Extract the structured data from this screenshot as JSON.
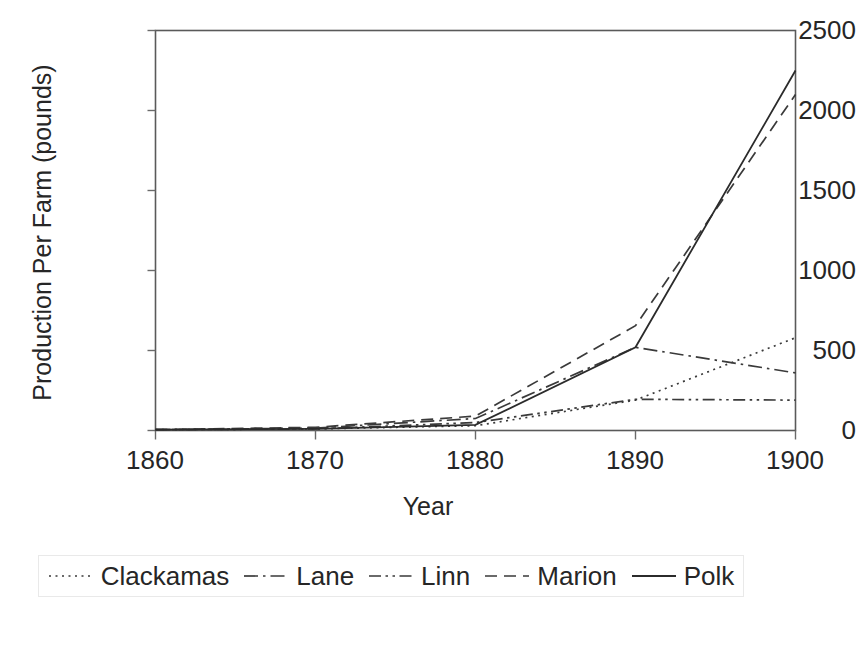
{
  "chart_data": {
    "type": "line",
    "title": "",
    "xlabel": "Year",
    "ylabel": "Production Per Farm (pounds)",
    "x": [
      1860,
      1870,
      1880,
      1890,
      1900
    ],
    "xticklabels": [
      "1860",
      "1870",
      "1880",
      "1890",
      "1900"
    ],
    "yticklabels": [
      "0",
      "500",
      "1000",
      "1500",
      "2000",
      "2500"
    ],
    "yticks": [
      0,
      500,
      1000,
      1500,
      2000,
      2500
    ],
    "xlim": [
      1860,
      1900
    ],
    "ylim": [
      0,
      2500
    ],
    "grid": false,
    "legend_position": "below-plot",
    "series": [
      {
        "name": "Clackamas",
        "dash": "dotted",
        "color": "#3a3a3a",
        "values": [
          5,
          10,
          30,
          190,
          580
        ]
      },
      {
        "name": "Lane",
        "dash": "dash-dot",
        "color": "#3a3a3a",
        "values": [
          5,
          15,
          75,
          520,
          360
        ]
      },
      {
        "name": "Linn",
        "dash": "dash-dot-dot",
        "color": "#3a3a3a",
        "values": [
          5,
          10,
          50,
          195,
          190
        ]
      },
      {
        "name": "Marion",
        "dash": "dashed",
        "color": "#3a3a3a",
        "values": [
          5,
          20,
          90,
          655,
          2100
        ]
      },
      {
        "name": "Polk",
        "dash": "solid",
        "color": "#2b2b2b",
        "values": [
          5,
          10,
          35,
          520,
          2250
        ]
      }
    ]
  },
  "axes": {
    "ylabel_text": "Production Per Farm (pounds)",
    "xlabel_text": "Year",
    "ytick_0": "0",
    "ytick_500": "500",
    "ytick_1000": "1000",
    "ytick_1500": "1500",
    "ytick_2000": "2000",
    "ytick_2500": "2500",
    "xtick_1860": "1860",
    "xtick_1870": "1870",
    "xtick_1880": "1880",
    "xtick_1890": "1890",
    "xtick_1900": "1900"
  },
  "legend": {
    "items": [
      {
        "label": "Clackamas"
      },
      {
        "label": "Lane"
      },
      {
        "label": "Linn"
      },
      {
        "label": "Marion"
      },
      {
        "label": "Polk"
      }
    ]
  },
  "colors": {
    "plot_border": "#5a5a5a",
    "text": "#262626",
    "background": "#ffffff"
  }
}
